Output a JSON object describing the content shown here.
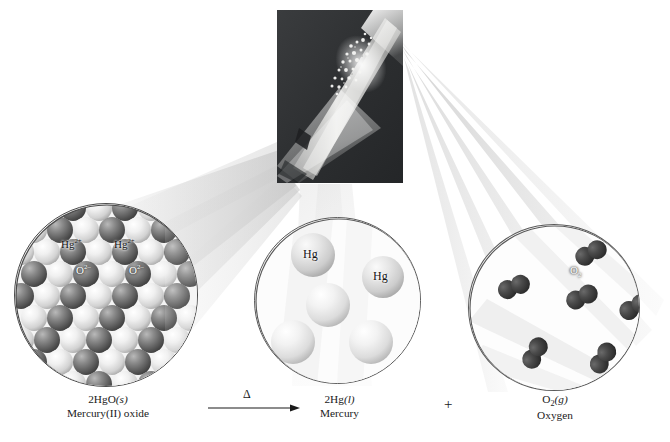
{
  "figure": {
    "type": "chemistry-reaction-diagram"
  },
  "photo": {
    "caption_text": "",
    "description": "test-tube-heating-mercury-oxide",
    "background_color": "#2f3133",
    "highlight_color": "#f2f2f0"
  },
  "circles": {
    "oxide": {
      "title": "mercury(II) oxide crystal lattice",
      "labels": [
        {
          "text_main": "Hg",
          "sup": "2+",
          "style": "dark",
          "x": 46,
          "y": 34
        },
        {
          "text_main": "Hg",
          "sup": "2+",
          "style": "dark",
          "x": 99,
          "y": 34
        },
        {
          "text_main": "O",
          "sup": "2–",
          "style": "light",
          "x": 61,
          "y": 60
        },
        {
          "text_main": "O",
          "sup": "2–",
          "style": "light",
          "x": 114,
          "y": 60
        }
      ]
    },
    "mercury": {
      "title": "liquid mercury atoms",
      "labels": [
        {
          "text_main": "Hg",
          "sup": "",
          "style": "dark",
          "x": 50,
          "y": 28
        },
        {
          "text_main": "Hg",
          "sup": "",
          "style": "dark",
          "x": 120,
          "y": 52
        }
      ]
    },
    "oxygen": {
      "title": "oxygen gas molecules",
      "labels": [
        {
          "text_main": "O",
          "sub": "2",
          "style": "light",
          "x": 101,
          "y": 40
        }
      ]
    }
  },
  "captions": {
    "reactant": {
      "formula_main": "2HgO",
      "formula_state": "(s)",
      "name": "Mercury(II) oxide"
    },
    "product_1": {
      "formula_main": "2Hg",
      "formula_state": "(l)",
      "name": "Mercury"
    },
    "product_2": {
      "formula_main": "O",
      "formula_sub": "2",
      "formula_state": "(g)",
      "name": "Oxygen"
    }
  },
  "reaction": {
    "arrow_condition": "Δ",
    "plus": "+",
    "equation": "2HgO(s) → 2Hg(l) + O2(g)"
  },
  "colors": {
    "line": "#4a4a4a",
    "text": "#1a1a1a",
    "beam": "#d8d8d8",
    "oxide_dark_sphere": "#6f6f6f",
    "oxide_light_sphere": "#e8e8e8",
    "mercury_sphere": "#e3e3e3",
    "oxygen_sphere": "#3a3a3a"
  }
}
